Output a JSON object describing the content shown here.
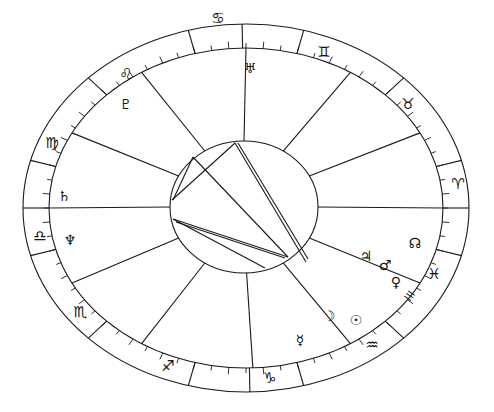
{
  "chart": {
    "type": "natal-chart-wheel",
    "center": {
      "x": 246,
      "y": 208
    },
    "outer_ring": {
      "rx": 223,
      "ry": 184
    },
    "zodiac_inner": {
      "rx": 197,
      "ry": 160
    },
    "aspect_circle": {
      "cx": 244,
      "cy": 207,
      "rx": 74,
      "ry": 66
    },
    "colors": {
      "line": "#1a1a1a",
      "background": "#ffffff"
    }
  },
  "zodiac_signs": [
    {
      "name": "cancer",
      "glyph": "♋",
      "x": 218,
      "y": 18
    },
    {
      "name": "gemini",
      "glyph": "♊",
      "x": 324,
      "y": 52
    },
    {
      "name": "taurus",
      "glyph": "♉",
      "x": 408,
      "y": 104
    },
    {
      "name": "aries",
      "glyph": "♈",
      "x": 458,
      "y": 184
    },
    {
      "name": "pisces",
      "glyph": "♓",
      "x": 434,
      "y": 274
    },
    {
      "name": "aquarius",
      "glyph": "♒",
      "x": 372,
      "y": 345
    },
    {
      "name": "capricorn",
      "glyph": "♑",
      "x": 270,
      "y": 378
    },
    {
      "name": "sagittarius",
      "glyph": "♐",
      "x": 168,
      "y": 366
    },
    {
      "name": "scorpio",
      "glyph": "♏",
      "x": 80,
      "y": 312
    },
    {
      "name": "libra",
      "glyph": "♎",
      "x": 40,
      "y": 236
    },
    {
      "name": "virgo",
      "glyph": "♍",
      "x": 52,
      "y": 143
    },
    {
      "name": "leo",
      "glyph": "♌",
      "x": 126,
      "y": 74
    }
  ],
  "planets": [
    {
      "name": "uranus",
      "glyph": "♅",
      "x": 250,
      "y": 68
    },
    {
      "name": "pluto",
      "glyph": "♇",
      "x": 126,
      "y": 104
    },
    {
      "name": "saturn",
      "glyph": "♄",
      "x": 64,
      "y": 196
    },
    {
      "name": "neptune",
      "glyph": "♆",
      "x": 70,
      "y": 240
    },
    {
      "name": "jupiter",
      "glyph": "♃",
      "x": 366,
      "y": 256
    },
    {
      "name": "mars",
      "glyph": "♂",
      "x": 385,
      "y": 265
    },
    {
      "name": "venus",
      "glyph": "♀",
      "x": 396,
      "y": 282
    },
    {
      "name": "node",
      "glyph": "☊",
      "x": 415,
      "y": 243
    },
    {
      "name": "moon",
      "glyph": "☽",
      "x": 329,
      "y": 316
    },
    {
      "name": "sun",
      "glyph": "☉",
      "x": 356,
      "y": 320
    },
    {
      "name": "mercury",
      "glyph": "☿",
      "x": 300,
      "y": 340
    }
  ],
  "house_markers": [
    {
      "label": "III",
      "x": 410,
      "y": 296,
      "rotate": -55
    }
  ]
}
